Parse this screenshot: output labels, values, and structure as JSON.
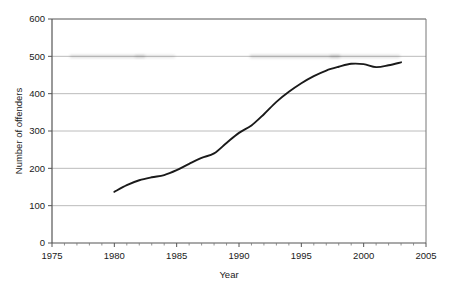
{
  "chart_data": {
    "type": "line",
    "title": "",
    "xlabel": "Year",
    "ylabel": "Number of offenders",
    "xlim": [
      1975,
      2005
    ],
    "ylim": [
      0,
      600
    ],
    "grid": true,
    "legend": false,
    "x_ticks": [
      "1975",
      "1980",
      "1985",
      "1990",
      "1995",
      "2000",
      "2005"
    ],
    "x_tick_values": [
      1975,
      1980,
      1985,
      1990,
      1995,
      2000,
      2005
    ],
    "x_minor_tick_interval": 1,
    "y_ticks": [
      "0",
      "100",
      "200",
      "300",
      "400",
      "500",
      "600"
    ],
    "y_tick_values": [
      0,
      100,
      200,
      300,
      400,
      500,
      600
    ],
    "line_color": "#1a1a1a",
    "grid_color": "#b4b4b4",
    "axis_color": "#555555",
    "series": [
      {
        "name": "Number of offenders",
        "x": [
          1980,
          1981,
          1982,
          1983,
          1984,
          1985,
          1986,
          1987,
          1988,
          1989,
          1990,
          1991,
          1992,
          1993,
          1994,
          1995,
          1996,
          1997,
          1998,
          1999,
          2000,
          2001,
          2002,
          2003
        ],
        "values": [
          137,
          155,
          168,
          176,
          182,
          195,
          212,
          228,
          240,
          268,
          295,
          315,
          345,
          378,
          405,
          428,
          447,
          462,
          472,
          480,
          479,
          471,
          476,
          484
        ]
      }
    ]
  },
  "figure": {
    "background": "#ffffff",
    "plot_left": 52,
    "plot_right": 426,
    "plot_top": 19,
    "plot_bottom": 243
  }
}
